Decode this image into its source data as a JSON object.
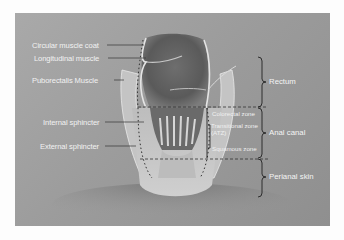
{
  "figure": {
    "left_labels": [
      {
        "id": "circular-muscle-coat",
        "text": "Circular muscle coat"
      },
      {
        "id": "longitudinal-muscle",
        "text": "Longitudinal muscle"
      },
      {
        "id": "puborectalis-muscle",
        "text": "Puborectalis Muscle"
      },
      {
        "id": "internal-sphincter",
        "text": "Internal sphincter"
      },
      {
        "id": "external-sphincter",
        "text": "External sphincter"
      }
    ],
    "zone_labels": [
      {
        "id": "colorectal-zone",
        "text": "Colorectal zone"
      },
      {
        "id": "transitional-zone",
        "text": "Transitional zone",
        "text2": "(ATZ)"
      },
      {
        "id": "squamous-zone",
        "text": "Squamous zone"
      }
    ],
    "region_labels": [
      {
        "id": "rectum",
        "text": "Rectum"
      },
      {
        "id": "anal-canal",
        "text": "Anal canal"
      },
      {
        "id": "perianal-skin",
        "text": "Perianal skin"
      }
    ]
  }
}
